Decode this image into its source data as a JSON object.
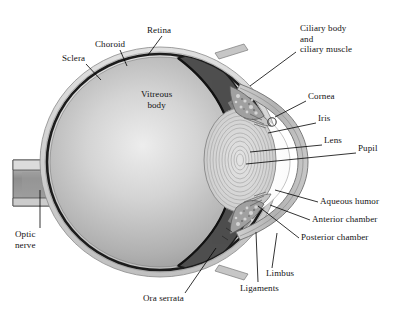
{
  "figure": {
    "background_color": "#ffffff",
    "text_color": "#111111"
  },
  "palette": {
    "sclera_outer": "#d7d7d7",
    "sclera_mid": "#c2c2c2",
    "choroid_dark": "#1c1c1c",
    "retina_band": "#6f6f6f",
    "vitreous_light": "#e9e9e9",
    "vitreous_mid": "#b4b4b4",
    "vitreous_edge": "#8f8f8f",
    "cut_retina": "#555555",
    "striation": "#9a9a9a",
    "lens_fill": "#dadada",
    "lens_ring": "#a8a8a8",
    "aqueous_white": "#fbfbfb",
    "cornea_band": "#b9b9b9",
    "ciliary_mottle": "#9d9d9d",
    "optic_nerve_core": "#8e8e8e",
    "optic_nerve_sheath": "#d2d2d2",
    "leader_line": "#000000"
  },
  "labels": [
    {
      "id": "sclera",
      "text": "Sclera",
      "x": 62,
      "y": 53,
      "align": "center",
      "leader": [
        [
          86,
          64
        ],
        [
          101,
          80
        ]
      ]
    },
    {
      "id": "choroid",
      "text": "Choroid",
      "x": 95,
      "y": 39,
      "align": "center",
      "leader": [
        [
          120,
          50
        ],
        [
          127,
          66
        ]
      ]
    },
    {
      "id": "retina",
      "text": "Retina",
      "x": 147,
      "y": 25,
      "align": "center",
      "leader": [
        [
          162,
          36
        ],
        [
          148,
          55
        ]
      ]
    },
    {
      "id": "ciliary-body-and-ciliary-muscle",
      "text": "Ciliary body\nand\nciliary muscle",
      "x": 300,
      "y": 23,
      "align": "right",
      "leader": [
        [
          296,
          52
        ],
        [
          250,
          86
        ]
      ]
    },
    {
      "id": "cornea",
      "text": "Cornea",
      "x": 308,
      "y": 91,
      "align": "right",
      "leader": [
        [
          306,
          101
        ],
        [
          275,
          117
        ]
      ]
    },
    {
      "id": "iris",
      "text": "Iris",
      "x": 318,
      "y": 113,
      "align": "right",
      "leader": [
        [
          316,
          123
        ],
        [
          268,
          133
        ]
      ]
    },
    {
      "id": "lens",
      "text": "Lens",
      "x": 324,
      "y": 135,
      "align": "right",
      "leader": [
        [
          322,
          145
        ],
        [
          250,
          152
        ]
      ]
    },
    {
      "id": "pupil",
      "text": "Pupil",
      "x": 358,
      "y": 143,
      "align": "right",
      "leader": [
        [
          356,
          153
        ],
        [
          246,
          164
        ]
      ]
    },
    {
      "id": "aqueous-humor",
      "text": "Aqueous humor",
      "x": 320,
      "y": 196,
      "align": "right",
      "leader": [
        [
          318,
          202
        ],
        [
          275,
          190
        ]
      ]
    },
    {
      "id": "anterior-chamber",
      "text": "Anterior chamber",
      "x": 312,
      "y": 214,
      "align": "right",
      "leader": [
        [
          310,
          220
        ],
        [
          270,
          205
        ]
      ]
    },
    {
      "id": "posterior-chamber",
      "text": "Posterior chamber",
      "x": 301,
      "y": 232,
      "align": "right",
      "leader": [
        [
          299,
          238
        ],
        [
          258,
          206
        ]
      ]
    },
    {
      "id": "limbus",
      "text": "Limbus",
      "x": 266,
      "y": 268,
      "align": "right",
      "leader": [
        [
          272,
          268
        ],
        [
          277,
          233
        ]
      ]
    },
    {
      "id": "ligaments",
      "text": "Ligaments",
      "x": 240,
      "y": 283,
      "align": "right",
      "leader": [
        [
          258,
          282
        ],
        [
          256,
          232
        ]
      ]
    },
    {
      "id": "ora-serrata",
      "text": "Ora serrata",
      "x": 143,
      "y": 293,
      "align": "right",
      "leader": [
        [
          185,
          293
        ],
        [
          216,
          248
        ]
      ]
    },
    {
      "id": "optic-nerve",
      "text": "Optic\nnerve",
      "x": 15,
      "y": 229,
      "align": "right",
      "leader": [
        [
          40,
          228
        ],
        [
          40,
          190
        ]
      ]
    },
    {
      "id": "vitreous-body",
      "text": "Vitreous\nbody",
      "x": 141,
      "y": 89,
      "align": "center",
      "leader": null
    }
  ]
}
